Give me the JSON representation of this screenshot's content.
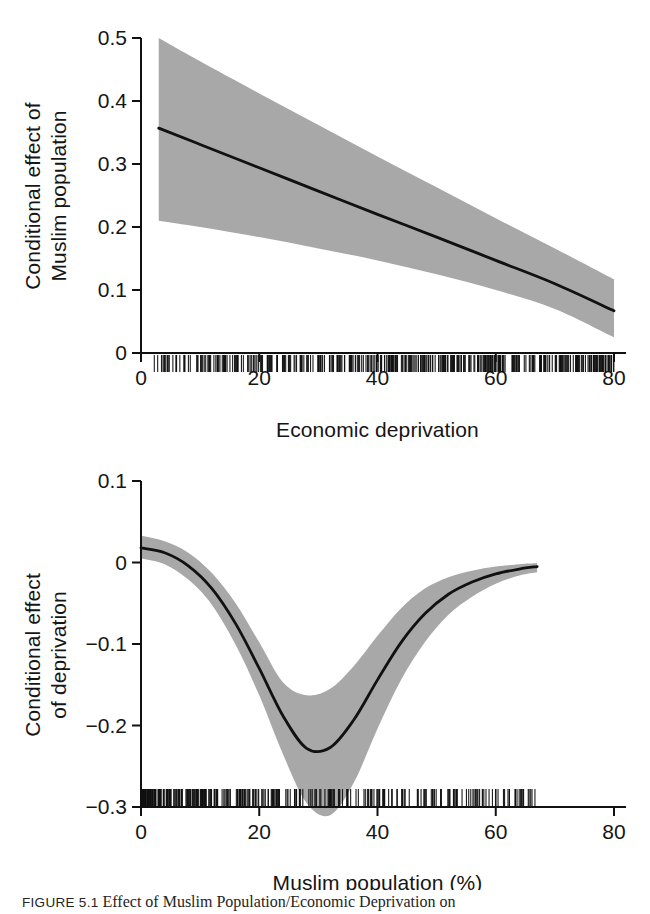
{
  "figure": {
    "caption_tag": "FIGURE 5.1",
    "caption_text": "Effect of Muslim Population/Economic Deprivation on"
  },
  "colors": {
    "band": "#a8a8a8",
    "line": "#111111",
    "axis": "#111111",
    "rug": "#111111",
    "background": "#ffffff"
  },
  "chart_data": [
    {
      "type": "line",
      "id": "top-panel",
      "title": "",
      "xlabel": "Economic deprivation",
      "ylabel": "Conditional effect of\nMuslim population",
      "ylabel_lines": [
        "Conditional effect of",
        "Muslim population"
      ],
      "xlim": [
        0,
        80
      ],
      "ylim": [
        0,
        0.5
      ],
      "xticks": [
        0,
        20,
        40,
        60,
        80
      ],
      "xtick_labels": [
        "0",
        "20",
        "40",
        "60",
        "80"
      ],
      "yticks": [
        0,
        0.1,
        0.2,
        0.3,
        0.4,
        0.5
      ],
      "ytick_labels": [
        "0",
        "0.1",
        "0.2",
        "0.3",
        "0.4",
        "0.5"
      ],
      "grid": false,
      "legend": "none",
      "series": [
        {
          "name": "Conditional effect of Muslim population",
          "x": [
            3,
            10,
            20,
            30,
            40,
            50,
            60,
            70,
            80
          ],
          "values": [
            0.357,
            0.331,
            0.294,
            0.257,
            0.22,
            0.184,
            0.147,
            0.11,
            0.067
          ]
        },
        {
          "name": "95% CI upper",
          "x": [
            3,
            10,
            20,
            30,
            40,
            50,
            60,
            70,
            80
          ],
          "values": [
            0.5,
            0.463,
            0.412,
            0.362,
            0.312,
            0.263,
            0.214,
            0.166,
            0.117
          ]
        },
        {
          "name": "95% CI lower",
          "x": [
            3,
            10,
            20,
            30,
            40,
            50,
            60,
            70,
            80
          ],
          "values": [
            0.21,
            0.2,
            0.184,
            0.166,
            0.147,
            0.125,
            0.1,
            0.07,
            0.025
          ]
        }
      ],
      "rug": {
        "label": "data rug at y = 0",
        "x_range": [
          2,
          80
        ],
        "density": "dense below 58, sparse above"
      }
    },
    {
      "type": "line",
      "id": "bottom-panel",
      "title": "",
      "xlabel": "Muslim population (%)",
      "ylabel": "Conditional effect\nof deprivation",
      "ylabel_lines": [
        "Conditional effect",
        "of deprivation"
      ],
      "xlim": [
        0,
        80
      ],
      "ylim": [
        -0.3,
        0.1
      ],
      "xticks": [
        0,
        20,
        40,
        60,
        80
      ],
      "xtick_labels": [
        "0",
        "20",
        "40",
        "60",
        "80"
      ],
      "yticks": [
        -0.3,
        -0.2,
        -0.1,
        0,
        0.1
      ],
      "ytick_labels": [
        "−0.3",
        "−0.2",
        "−0.1",
        "0",
        "0.1"
      ],
      "grid": false,
      "legend": "none",
      "series": [
        {
          "name": "Conditional effect of deprivation",
          "x": [
            0,
            4,
            8,
            12,
            16,
            20,
            24,
            28,
            32,
            36,
            40,
            44,
            48,
            52,
            56,
            60,
            64,
            67
          ],
          "values": [
            0.018,
            0.012,
            -0.004,
            -0.032,
            -0.075,
            -0.13,
            -0.188,
            -0.228,
            -0.227,
            -0.193,
            -0.144,
            -0.098,
            -0.063,
            -0.039,
            -0.024,
            -0.014,
            -0.008,
            -0.005
          ]
        },
        {
          "name": "95% CI upper",
          "x": [
            0,
            4,
            8,
            12,
            16,
            20,
            24,
            28,
            32,
            36,
            40,
            44,
            48,
            52,
            56,
            60,
            64,
            67
          ],
          "values": [
            0.033,
            0.026,
            0.012,
            -0.013,
            -0.05,
            -0.098,
            -0.147,
            -0.163,
            -0.155,
            -0.127,
            -0.09,
            -0.056,
            -0.032,
            -0.018,
            -0.01,
            -0.005,
            -0.002,
            -0.001
          ]
        },
        {
          "name": "95% CI lower",
          "x": [
            0,
            4,
            8,
            12,
            16,
            20,
            24,
            28,
            32,
            36,
            40,
            44,
            48,
            52,
            56,
            60,
            64,
            67
          ],
          "values": [
            0.005,
            -0.002,
            -0.021,
            -0.052,
            -0.101,
            -0.163,
            -0.235,
            -0.295,
            -0.31,
            -0.27,
            -0.204,
            -0.144,
            -0.098,
            -0.064,
            -0.042,
            -0.026,
            -0.016,
            -0.012
          ]
        }
      ],
      "rug": {
        "label": "data rug at bottom",
        "x_range": [
          0,
          67
        ],
        "density": "very dense below 22, sparse above 45"
      }
    }
  ]
}
